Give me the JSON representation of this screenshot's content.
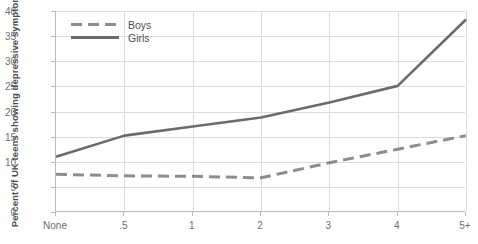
{
  "chart_data": {
    "type": "line",
    "title": "",
    "xlabel": "",
    "ylabel": "Percent of UK teens showing depressive symptoms",
    "categories": [
      "None",
      ".5",
      "1",
      "2",
      "3",
      "4",
      "5+"
    ],
    "xtick_labels": [
      "None",
      ".5",
      "1",
      "2",
      "3",
      "4",
      "5+"
    ],
    "ytick_labels": [
      "0",
      "5",
      "10",
      "15",
      "20",
      "25",
      "30",
      "35",
      "40"
    ],
    "yticks": [
      0,
      5,
      10,
      15,
      20,
      25,
      30,
      35,
      40
    ],
    "ylim": [
      0,
      40
    ],
    "grid": true,
    "legend_position": "top-left",
    "series": [
      {
        "name": "Boys",
        "style": "dashed",
        "color": "#8d8d8f",
        "values": [
          7.5,
          7.2,
          7.1,
          6.8,
          9.8,
          12.5,
          15.2
        ]
      },
      {
        "name": "Girls",
        "style": "solid",
        "color": "#6b6b6d",
        "values": [
          11.0,
          15.2,
          17.0,
          18.8,
          21.8,
          25.1,
          38.3
        ]
      }
    ]
  },
  "legend": {
    "items": [
      {
        "label": "Boys"
      },
      {
        "label": "Girls"
      }
    ]
  },
  "colors": {
    "grid": "#dcdcde",
    "axis": "#b9b9bb",
    "text": "#6d6e70",
    "boys": "#8d8d8f",
    "girls": "#6b6b6d"
  }
}
